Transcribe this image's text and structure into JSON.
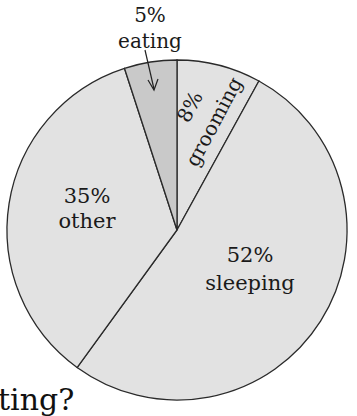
{
  "chart_data": {
    "type": "pie",
    "title": "",
    "start_angle_deg_from_top": 0,
    "direction": "clockwise",
    "slices": [
      {
        "label": "grooming",
        "percent": 8,
        "value_label": "8%",
        "color": "#e2e2e2"
      },
      {
        "label": "sleeping",
        "percent": 52,
        "value_label": "52%",
        "color": "#e2e2e2"
      },
      {
        "label": "other",
        "percent": 35,
        "value_label": "35%",
        "color": "#e2e2e2"
      },
      {
        "label": "eating",
        "percent": 5,
        "value_label": "5%",
        "color": "#c9c9c9"
      }
    ],
    "annotations": [
      {
        "text": "5%\neating",
        "target": "eating",
        "arrow": true
      }
    ],
    "legend": "none"
  },
  "labels": {
    "eating_pct": "5%",
    "eating_name": "eating",
    "grooming_pct": "8%",
    "grooming_name": "grooming",
    "other_pct": "35%",
    "other_name": "other",
    "sleeping_pct": "52%",
    "sleeping_name": "sleeping"
  },
  "question_fragment": "ting?"
}
